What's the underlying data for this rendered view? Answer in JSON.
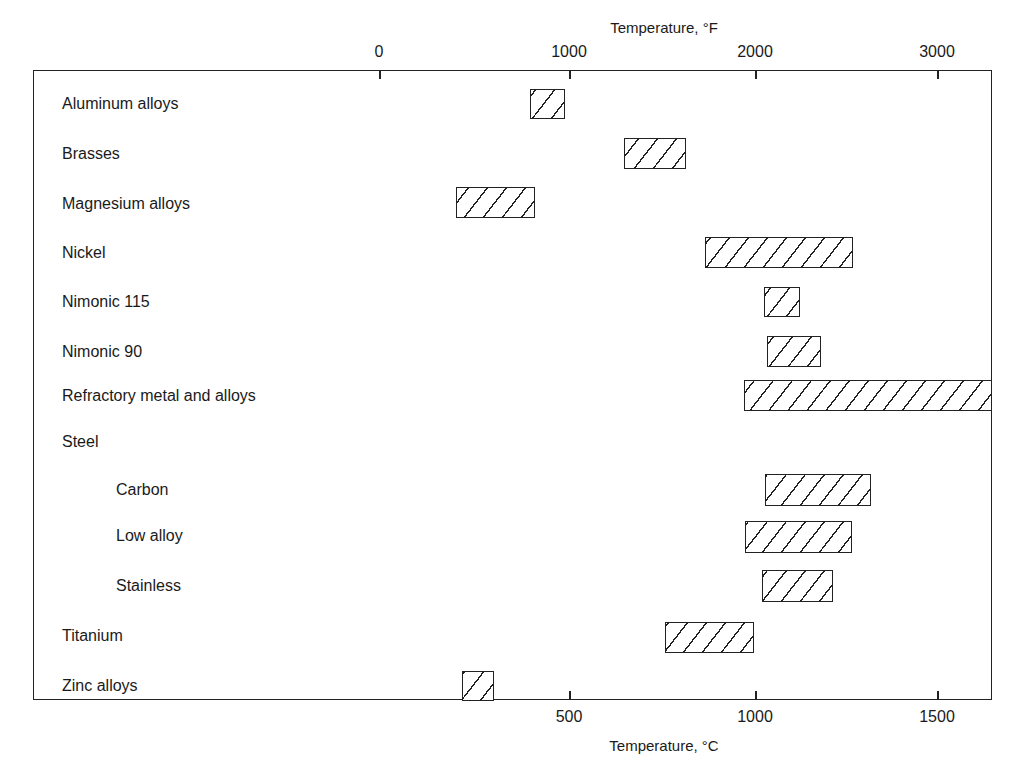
{
  "chart_data": {
    "type": "bar",
    "orientation": "horizontal-range",
    "title": "",
    "xlabel_bottom": "Temperature, °C",
    "xlabel_top": "Temperature, °F",
    "bottom_ticks": [
      "500",
      "1000",
      "1500"
    ],
    "bottom_tick_values": [
      500,
      1000,
      1500
    ],
    "top_ticks": [
      "0",
      "1000",
      "2000",
      "3000"
    ],
    "top_tick_values": [
      0,
      1000,
      2000,
      3000
    ],
    "xlim_celsius": [
      -18,
      1650
    ],
    "grid": false,
    "legend": null,
    "categories": [
      "Aluminum alloys",
      "Brasses",
      "Magnesium alloys",
      "Nickel",
      "Nimonic 115",
      "Nimonic 90",
      "Refractory metal and alloys",
      "Steel",
      "Carbon",
      "Low alloy",
      "Stainless",
      "Titanium",
      "Zinc alloys"
    ],
    "ranges_celsius": [
      {
        "name": "Aluminum alloys",
        "min": 390,
        "max": 480
      },
      {
        "name": "Brasses",
        "min": 650,
        "max": 815
      },
      {
        "name": "Magnesium alloys",
        "min": 190,
        "max": 405
      },
      {
        "name": "Nickel",
        "min": 870,
        "max": 1270
      },
      {
        "name": "Nimonic 115",
        "min": 1030,
        "max": 1125
      },
      {
        "name": "Nimonic 90",
        "min": 1040,
        "max": 1180
      },
      {
        "name": "Refractory metal and alloys",
        "min": 975,
        "max": 1650
      },
      {
        "name": "Steel",
        "min": null,
        "max": null
      },
      {
        "name": "Carbon",
        "min": 1035,
        "max": 1320
      },
      {
        "name": "Low alloy",
        "min": 980,
        "max": 1265
      },
      {
        "name": "Stainless",
        "min": 1025,
        "max": 1215
      },
      {
        "name": "Titanium",
        "min": 760,
        "max": 1000
      },
      {
        "name": "Zinc alloys",
        "min": 205,
        "max": 290
      }
    ]
  },
  "axes": {
    "top_title": "Temperature, °F",
    "bottom_title": "Temperature, °C",
    "top_ticks": [
      {
        "label": "0",
        "x": 379
      },
      {
        "label": "1000",
        "x": 569
      },
      {
        "label": "2000",
        "x": 755
      },
      {
        "label": "3000",
        "x": 937
      }
    ],
    "bottom_ticks": [
      {
        "label": "500",
        "x": 569
      },
      {
        "label": "1000",
        "x": 755
      },
      {
        "label": "1500",
        "x": 937
      }
    ]
  },
  "rows": [
    {
      "label": "Aluminum alloys",
      "indent": false,
      "label_y": 95,
      "bar": {
        "x": 530,
        "y": 89,
        "w": 35,
        "h": 30
      }
    },
    {
      "label": "Brasses",
      "indent": false,
      "label_y": 145,
      "bar": {
        "x": 624,
        "y": 138,
        "w": 62,
        "h": 31
      }
    },
    {
      "label": "Magnesium alloys",
      "indent": false,
      "label_y": 195,
      "bar": {
        "x": 456,
        "y": 187,
        "w": 79,
        "h": 31
      }
    },
    {
      "label": "Nickel",
      "indent": false,
      "label_y": 244,
      "bar": {
        "x": 705,
        "y": 237,
        "w": 148,
        "h": 31
      }
    },
    {
      "label": "Nimonic 115",
      "indent": false,
      "label_y": 293,
      "bar": {
        "x": 764,
        "y": 287,
        "w": 36,
        "h": 30
      }
    },
    {
      "label": "Nimonic 90",
      "indent": false,
      "label_y": 343,
      "bar": {
        "x": 767,
        "y": 336,
        "w": 54,
        "h": 31
      }
    },
    {
      "label": "Refractory metal and alloys",
      "indent": false,
      "label_y": 387,
      "bar": {
        "x": 744,
        "y": 380,
        "w": 248,
        "h": 31
      }
    },
    {
      "label": "Steel",
      "indent": false,
      "label_y": 433,
      "bar": null
    },
    {
      "label": "Carbon",
      "indent": true,
      "label_y": 481,
      "bar": {
        "x": 765,
        "y": 474,
        "w": 106,
        "h": 32
      }
    },
    {
      "label": "Low alloy",
      "indent": true,
      "label_y": 527,
      "bar": {
        "x": 745,
        "y": 521,
        "w": 107,
        "h": 32
      }
    },
    {
      "label": "Stainless",
      "indent": true,
      "label_y": 577,
      "bar": {
        "x": 762,
        "y": 570,
        "w": 71,
        "h": 32
      }
    },
    {
      "label": "Titanium",
      "indent": false,
      "label_y": 627,
      "bar": {
        "x": 665,
        "y": 622,
        "w": 89,
        "h": 31
      }
    },
    {
      "label": "Zinc alloys",
      "indent": false,
      "label_y": 677,
      "bar": {
        "x": 462,
        "y": 671,
        "w": 32,
        "h": 30
      }
    }
  ]
}
